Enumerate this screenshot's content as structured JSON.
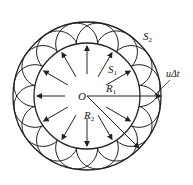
{
  "diagram": {
    "center": {
      "label": "O",
      "x": 87,
      "y": 96
    },
    "inner_wavefront": {
      "label": "S",
      "subscript": "1",
      "radius": 53
    },
    "outer_wavefront": {
      "label": "S",
      "subscript": "2",
      "radius": 74
    },
    "wavelets": {
      "count": 16,
      "radius": 21
    },
    "radius_labels": [
      {
        "label": "R",
        "subscript": "1"
      },
      {
        "label": "R",
        "subscript": "2"
      }
    ],
    "distance_label": "uΔt",
    "arrow_count": 12,
    "colors": {
      "stroke": "#222222",
      "background": "#ffffff"
    }
  }
}
